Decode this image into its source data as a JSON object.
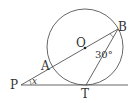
{
  "diagram": {
    "type": "geometry",
    "points": {
      "P": {
        "label": "P"
      },
      "A": {
        "label": "A"
      },
      "O": {
        "label": "O"
      },
      "B": {
        "label": "B"
      },
      "T": {
        "label": "T"
      }
    },
    "angle_OBT": "30°",
    "angle_P": "x",
    "elements": [
      "circle centered at O",
      "secant P-A-O-B",
      "tangent line P-T",
      "chord B-T"
    ]
  }
}
